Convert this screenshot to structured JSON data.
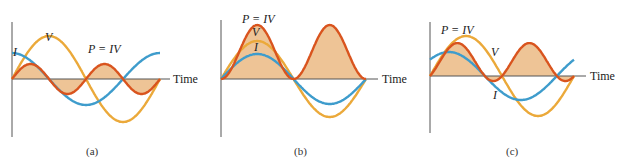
{
  "colors": {
    "power": "#d9541e",
    "power_fill": "#eec496",
    "voltage": "#eba93a",
    "current": "#3e9ccc",
    "axis": "#555555"
  },
  "panels": [
    {
      "caption": "(a)",
      "axis_label": "Time",
      "labels": {
        "current": "I",
        "voltage": "V",
        "power": "P = IV"
      },
      "description": "Current leads voltage by 90 degrees; power alternates positive and negative"
    },
    {
      "caption": "(b)",
      "axis_label": "Time",
      "labels": {
        "current": "I",
        "voltage": "V",
        "power": "P = IV"
      },
      "description": "Current and voltage in phase; power always positive"
    },
    {
      "caption": "(c)",
      "axis_label": "Time",
      "labels": {
        "current": "I",
        "voltage": "V",
        "power": "P = IV"
      },
      "description": "Current leads voltage by a partial phase; power mostly positive"
    }
  ],
  "chart_data": [
    {
      "type": "line",
      "title": "(a)",
      "xlabel": "Time",
      "series": [
        {
          "name": "V",
          "phase_deg": 0
        },
        {
          "name": "I",
          "phase_deg": 90
        },
        {
          "name": "P = IV",
          "note": "product, filled"
        }
      ]
    },
    {
      "type": "line",
      "title": "(b)",
      "xlabel": "Time",
      "series": [
        {
          "name": "V",
          "phase_deg": 0
        },
        {
          "name": "I",
          "phase_deg": 0
        },
        {
          "name": "P = IV",
          "note": "product, filled"
        }
      ]
    },
    {
      "type": "line",
      "title": "(c)",
      "xlabel": "Time",
      "series": [
        {
          "name": "V",
          "phase_deg": 0
        },
        {
          "name": "I",
          "phase_deg": 45
        },
        {
          "name": "P = IV",
          "note": "product, filled"
        }
      ]
    }
  ]
}
